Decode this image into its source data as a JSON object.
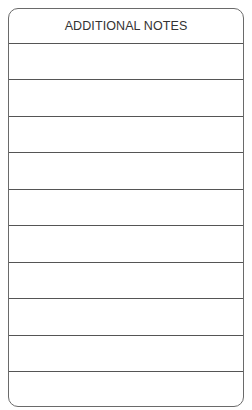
{
  "form": {
    "title": "ADDITIONAL NOTES",
    "line_count": 10,
    "lines": [
      "",
      "",
      "",
      "",
      "",
      "",
      "",
      "",
      "",
      ""
    ]
  },
  "colors": {
    "border": "#6a6a6a",
    "rule": "#555555",
    "text": "#333333"
  }
}
